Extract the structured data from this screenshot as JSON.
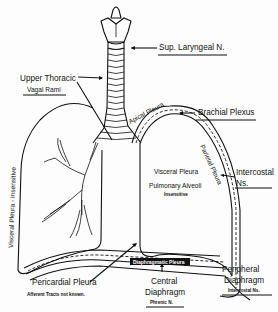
{
  "diagram": {
    "labels": {
      "sup_laryngeal": "Sup. Laryngeal N.",
      "upper_thoracic": "Upper Thoracic",
      "vagal_rami": "Vagal Rami",
      "apical_pleura": "Apical Pleura",
      "brachial_plexus": "Brachial Plexus",
      "parietal_pleura": "Parietal Pleura",
      "intercostal": "Intercostal",
      "intercostal_ns": "Ns.",
      "visceral_pleura": "Visceral Pleura",
      "pulmonary_alveoli": "Pulmonary Alveoli",
      "insensitive": "Insensitive",
      "visceral_pleura_left": "Visceral Pleura - insensitive",
      "pericardial_pleura": "Pericardial Pleura",
      "afferent_tracts": "Afferent Tracts not known.",
      "diaphragmatic_pleura": "Diaphragmatic Pleura",
      "central": "Central",
      "central_diaphragm": "Diaphragm",
      "phrenic": "Phrenic N.",
      "peripheral": "Peripheral",
      "peripheral_diaphragm": "Diaphragm",
      "peripheral_intercostal": "Intercostal Ns."
    },
    "colors": {
      "ink": "#111111",
      "paper": "#fdfdfd"
    }
  }
}
